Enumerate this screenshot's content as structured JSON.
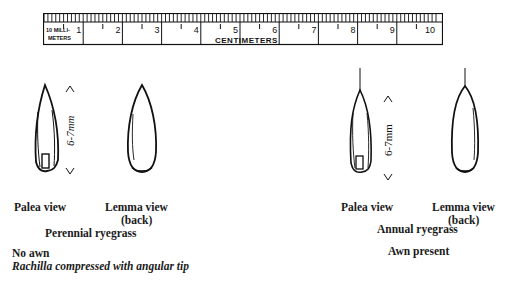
{
  "ruler": {
    "small_label_line1": "10 MILLI-",
    "small_label_line2": "METERS",
    "unit_label": "CENTIMETERS",
    "numbers": [
      "1",
      "2",
      "3",
      "4",
      "5",
      "6",
      "7",
      "8",
      "9",
      "10"
    ]
  },
  "perennial": {
    "palea_label": "Palea view",
    "lemma_label": "Lemma view",
    "lemma_sub": "(back)",
    "name": "Perennial ryegrass",
    "measure": "6-7mm",
    "note1": "No awn",
    "note2": "Rachilla compressed with angular tip"
  },
  "annual": {
    "palea_label": "Palea view",
    "lemma_label": "Lemma view",
    "lemma_sub": "(back)",
    "name": "Annual ryegrass",
    "measure": "6-7mm",
    "note1": "Awn present"
  }
}
